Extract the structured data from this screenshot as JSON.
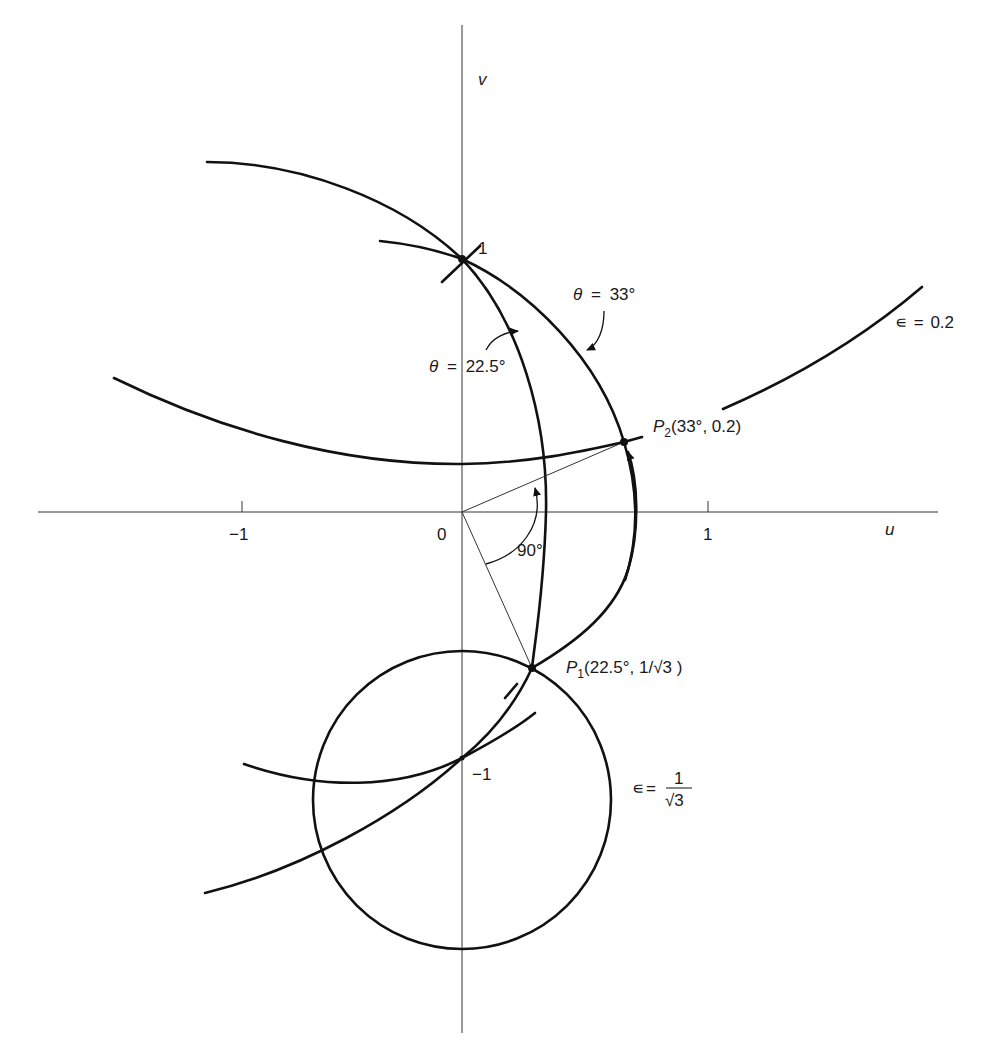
{
  "axes": {
    "horizontal_label": "u",
    "vertical_label": "v",
    "origin_label": "0",
    "u_ticks": [
      {
        "value": -1,
        "label": "−1"
      },
      {
        "value": 1,
        "label": "1"
      }
    ],
    "v_ticks": [
      {
        "value": 1,
        "label": "1"
      },
      {
        "value": -1,
        "label": "−1"
      }
    ]
  },
  "curves": {
    "theta_22_5": {
      "symbol": "θ",
      "eq": "=",
      "value": "22.5°"
    },
    "theta_33": {
      "symbol": "θ",
      "eq": "=",
      "value": "33°"
    },
    "eps_0_2": {
      "symbol": "∊",
      "eq": "=",
      "value": "0.2"
    },
    "eps_1_sqrt3": {
      "symbol": "∊",
      "eq": "=",
      "numerator": "1",
      "denominator": "√3"
    }
  },
  "points": {
    "p1": {
      "name": "P",
      "sub": "1",
      "coords": "(22.5°, 1/√3 )"
    },
    "p2": {
      "name": "P",
      "sub": "2",
      "coords": "(33°, 0.2)"
    }
  },
  "angle_label": "90°",
  "colors": {
    "ink": "#111111",
    "axis": "#333333",
    "background": "#ffffff"
  }
}
